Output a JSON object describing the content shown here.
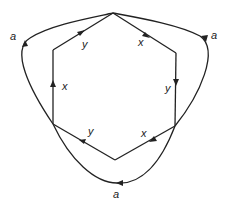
{
  "diagram": {
    "type": "graph",
    "vertices": [
      {
        "id": "top",
        "x": 113,
        "y": 13
      },
      {
        "id": "upper-right",
        "x": 176,
        "y": 53
      },
      {
        "id": "lower-right",
        "x": 175,
        "y": 126
      },
      {
        "id": "bottom",
        "x": 115,
        "y": 160
      },
      {
        "id": "lower-left",
        "x": 53,
        "y": 124
      },
      {
        "id": "upper-left",
        "x": 53,
        "y": 50
      }
    ],
    "edges": [
      {
        "from": "upper-left",
        "to": "top",
        "label": "y"
      },
      {
        "from": "top",
        "to": "upper-right",
        "label": "x"
      },
      {
        "from": "upper-right",
        "to": "lower-right",
        "label": "y"
      },
      {
        "from": "lower-right",
        "to": "bottom",
        "label": "x"
      },
      {
        "from": "bottom",
        "to": "lower-left",
        "label": "y"
      },
      {
        "from": "lower-left",
        "to": "upper-left",
        "label": "x"
      },
      {
        "from": "lower-left",
        "to": "top",
        "label": "a",
        "curved": true
      },
      {
        "from": "top",
        "to": "lower-right",
        "label": "a",
        "curved": true
      },
      {
        "from": "lower-right",
        "to": "lower-left",
        "label": "a",
        "curved": true
      }
    ],
    "labels": {
      "ul_top": "y",
      "top_ur": "x",
      "ur_lr": "y",
      "lr_bottom": "x",
      "bottom_ll": "y",
      "ll_ul": "x",
      "a_left": "a",
      "a_right": "a",
      "a_bottom": "a"
    }
  }
}
